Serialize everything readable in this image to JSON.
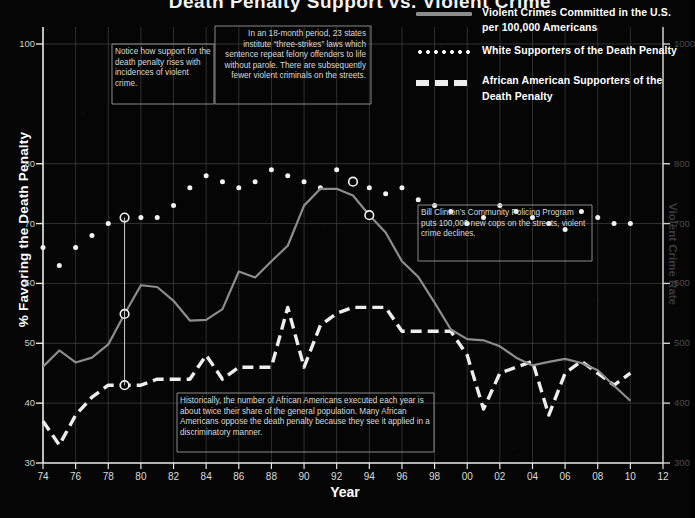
{
  "title": "Death Penalty Support vs. Violent Crime",
  "axes": {
    "ylabel": "% Favoring the Death Penalty",
    "xlabel": "Year",
    "rlabel": "Violent Crime Rate",
    "yticks": [
      100,
      80,
      70,
      60,
      50,
      40,
      30
    ],
    "rticks": [
      1000,
      800,
      700,
      600,
      500,
      400,
      300
    ],
    "xticks": [
      "74",
      "76",
      "78",
      "80",
      "82",
      "84",
      "86",
      "88",
      "90",
      "92",
      "94",
      "96",
      "98",
      "00",
      "02",
      "04",
      "06",
      "08",
      "10",
      "12"
    ]
  },
  "legend": [
    {
      "key": "violent",
      "style": "solid",
      "label": "Violent Crimes Committed in the U.S. per 100,000 Americans",
      "color": "#8d8d8d"
    },
    {
      "key": "white",
      "style": "dotted",
      "label": "White Supporters of the Death Penalty",
      "color": "#f2f2f2"
    },
    {
      "key": "black",
      "style": "dashed",
      "label": "African American Supporters of the Death Penalty",
      "color": "#ededed"
    }
  ],
  "notes": {
    "note1": "Notice how support for the death penalty rises with incidences of violent crime.",
    "note2": "In an 18-month period, 23 states institute “three-strikes” laws which sentence repeat felony offenders to life without parole. There are subsequently fewer violent criminals on the streets.",
    "note3": "Bill Clinton’s Community Policing Program puts 100,000 new cops on the streets, violent crime declines.",
    "note4": "Historically, the number of African Americans executed each year is about twice their share of the general population. Many African Americans oppose the death penalty because they see it applied in a discriminatory manner."
  },
  "chart_data": {
    "type": "line",
    "title": "Death Penalty Support vs. Violent Crime",
    "xlabel": "Year",
    "ylabel": "% Favoring the Death Penalty",
    "y2label": "Violent Crime Rate",
    "ylim": [
      30,
      105
    ],
    "y2lim": [
      300,
      1050
    ],
    "xlim": [
      1974,
      2012
    ],
    "grid": true,
    "legend_position": "top-right",
    "x": [
      1974,
      1975,
      1976,
      1977,
      1978,
      1979,
      1980,
      1981,
      1982,
      1983,
      1984,
      1985,
      1986,
      1987,
      1988,
      1989,
      1990,
      1991,
      1992,
      1993,
      1994,
      1995,
      1996,
      1997,
      1998,
      1999,
      2000,
      2001,
      2002,
      2003,
      2004,
      2005,
      2006,
      2007,
      2008,
      2009,
      2010
    ],
    "series": [
      {
        "name": "White Supporters of the Death Penalty",
        "axis": "left",
        "style": "dotted",
        "values": [
          66,
          63,
          66,
          68,
          70,
          71,
          71,
          71,
          73,
          76,
          78,
          77,
          76,
          77,
          79,
          78,
          77,
          76,
          79,
          77,
          76,
          75,
          76,
          74,
          73,
          72,
          70,
          71,
          73,
          72,
          71,
          70,
          69,
          72,
          71,
          70,
          70
        ]
      },
      {
        "name": "African American Supporters of the Death Penalty",
        "axis": "left",
        "style": "dashed",
        "values": [
          37,
          33,
          38,
          41,
          43,
          43,
          43,
          44,
          44,
          44,
          48,
          44,
          46,
          46,
          46,
          56,
          46,
          53,
          55,
          56,
          56,
          56,
          52,
          52,
          52,
          52,
          48,
          39,
          45,
          46,
          47,
          38,
          45,
          47,
          45,
          43,
          45
        ]
      },
      {
        "name": "Violent Crimes Committed in the U.S. per 100,000 Americans",
        "axis": "right",
        "style": "solid",
        "values": [
          461,
          488,
          468,
          476,
          498,
          549,
          597,
          594,
          571,
          538,
          539,
          557,
          620,
          610,
          637,
          663,
          730,
          758,
          758,
          747,
          714,
          685,
          637,
          611,
          568,
          523,
          507,
          505,
          495,
          476,
          463,
          469,
          474,
          467,
          455,
          429,
          404
        ]
      }
    ],
    "markers": [
      {
        "series": "White Supporters of the Death Penalty",
        "x": 1979,
        "y": 71
      },
      {
        "series": "Violent Crimes Committed in the U.S. per 100,000 Americans",
        "x": 1979,
        "y": 549
      },
      {
        "series": "African American Supporters of the Death Penalty",
        "x": 1979,
        "y": 43
      },
      {
        "series": "White Supporters of the Death Penalty",
        "x": 1993,
        "y": 77
      },
      {
        "series": "Violent Crimes Committed in the U.S. per 100,000 Americans",
        "x": 1994,
        "y": 714
      }
    ]
  }
}
